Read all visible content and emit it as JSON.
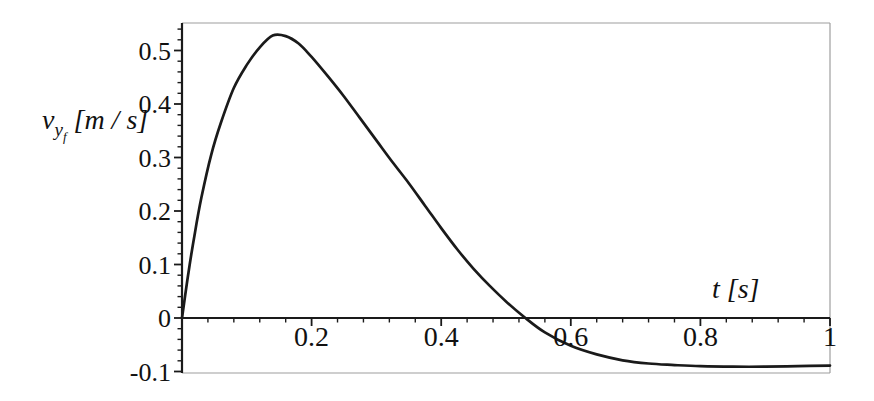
{
  "figure": {
    "background": "#ffffff"
  },
  "labels": {
    "y": {
      "variable": "v",
      "subscript": "y",
      "subsubscript": "f",
      "units": "[m / s]"
    },
    "x": {
      "variable": "t",
      "units": "[s]"
    }
  },
  "chart_data": {
    "type": "line",
    "title": "",
    "xlabel": "t [s]",
    "ylabel": "v_y_f [m / s]",
    "xlim": [
      0,
      1
    ],
    "ylim": [
      -0.103,
      0.553
    ],
    "grid": false,
    "legend": false,
    "x_ticks": [
      {
        "value": 0.2,
        "label": "0.2"
      },
      {
        "value": 0.4,
        "label": "0.4"
      },
      {
        "value": 0.6,
        "label": "0.6"
      },
      {
        "value": 0.8,
        "label": "0.8"
      },
      {
        "value": 1,
        "label": "1"
      }
    ],
    "x_minor_step": 0.04,
    "y_ticks": [
      {
        "value": 0.5,
        "label": "0.5"
      },
      {
        "value": 0.4,
        "label": "0.4"
      },
      {
        "value": 0.3,
        "label": "0.3"
      },
      {
        "value": 0.2,
        "label": "0.2"
      },
      {
        "value": 0.1,
        "label": "0.1"
      },
      {
        "value": 0,
        "label": "0"
      },
      {
        "value": -0.1,
        "label": "-0.1"
      }
    ],
    "y_minor_step": 0.02,
    "colors": {
      "curve": "#1a1a1a",
      "axis": "#1a1a1a",
      "frame": "#9e9e9e",
      "text": "#111111"
    },
    "series": [
      {
        "name": "v_y_f(t)",
        "x": [
          0,
          0.01,
          0.02,
          0.03,
          0.045,
          0.06,
          0.08,
          0.1,
          0.12,
          0.14,
          0.16,
          0.18,
          0.2,
          0.225,
          0.25,
          0.275,
          0.3,
          0.325,
          0.35,
          0.375,
          0.4,
          0.425,
          0.45,
          0.475,
          0.5,
          0.53,
          0.56,
          0.6,
          0.64,
          0.68,
          0.72,
          0.76,
          0.8,
          0.85,
          0.9,
          0.95,
          1.0
        ],
        "y": [
          0,
          0.085,
          0.16,
          0.225,
          0.305,
          0.365,
          0.43,
          0.473,
          0.506,
          0.528,
          0.527,
          0.513,
          0.488,
          0.452,
          0.414,
          0.373,
          0.332,
          0.291,
          0.252,
          0.21,
          0.168,
          0.128,
          0.092,
          0.06,
          0.031,
          0.0,
          -0.027,
          -0.052,
          -0.068,
          -0.079,
          -0.085,
          -0.088,
          -0.09,
          -0.091,
          -0.091,
          -0.09,
          -0.089
        ]
      }
    ]
  }
}
